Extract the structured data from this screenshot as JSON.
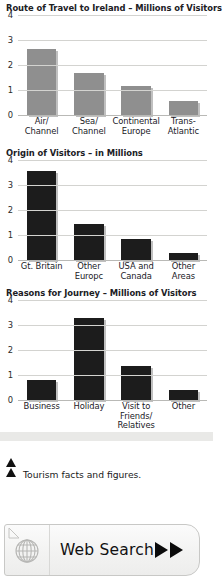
{
  "caption": {
    "text": "Tourism facts and figures.",
    "marker_icon": "triangle-up-icon"
  },
  "web_search": {
    "label": "Web Search",
    "globe_icon": "globe-icon",
    "arrow_icon": "play-arrow-icon"
  },
  "chart_data": [
    {
      "type": "bar",
      "title": "Route of Travel to Ireland – Millions of Visitors",
      "categories": [
        "Air/\nChannel",
        "Sea/\nChannel",
        "Continental\nEurope",
        "Trans-\nAtlantic"
      ],
      "values": [
        2.65,
        1.68,
        1.15,
        0.55
      ],
      "ticks": [
        "4",
        "3",
        "2",
        "1",
        "0"
      ],
      "ylim": [
        0,
        4
      ],
      "xlabel": "",
      "ylabel": "",
      "grid": true,
      "bar_color": "#8f8f8f"
    },
    {
      "type": "bar",
      "title": "Origin of Visitors – in Millions",
      "categories": [
        "Gt. Britain",
        "Other\nEuropc",
        "USA and\nCanada",
        "Other\nAreas"
      ],
      "values": [
        3.55,
        1.45,
        0.85,
        0.3
      ],
      "ticks": [
        "4",
        "3",
        "2",
        "1",
        "0"
      ],
      "ylim": [
        0,
        4
      ],
      "xlabel": "",
      "ylabel": "",
      "grid": true,
      "bar_color": "#1c1c1c"
    },
    {
      "type": "bar",
      "title": "Reasons for Journey – Millions of Visitors",
      "categories": [
        "Business",
        "Holiday",
        "Visit to\nFriends/\nRelatives",
        "Other"
      ],
      "values": [
        0.8,
        3.3,
        1.35,
        0.4
      ],
      "ticks": [
        "4",
        "3",
        "2",
        "1",
        "0"
      ],
      "ylim": [
        0,
        4
      ],
      "xlabel": "",
      "ylabel": "",
      "grid": true,
      "bar_color": "#1c1c1c"
    }
  ]
}
